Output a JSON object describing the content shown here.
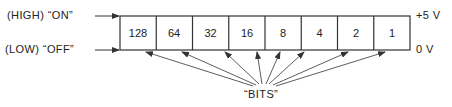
{
  "diagram": {
    "labels": {
      "high": "(HIGH) “ON”",
      "low": "(LOW) “OFF”",
      "plus5v": "+5 V",
      "zerov": "0 V",
      "bits": "“BITS”"
    },
    "cells": [
      "128",
      "64",
      "32",
      "16",
      "8",
      "4",
      "2",
      "1"
    ],
    "colors": {
      "line": "#333333",
      "text": "#222222",
      "background": "#ffffff"
    }
  }
}
